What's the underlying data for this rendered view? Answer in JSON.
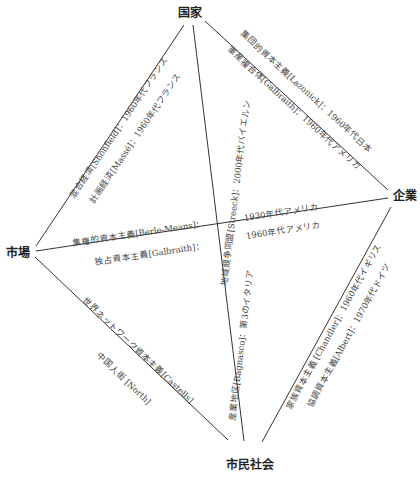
{
  "nodes": {
    "top": "国家",
    "left": "市場",
    "right": "企業",
    "bottom": "市民社会"
  },
  "edges": {
    "state_market": {
      "upper": "混合経済[Shonfield]：1960年代フランス",
      "lower": "計画経済[Massé]：1960年代フランス"
    },
    "state_firm": {
      "upper": "集団的資本主義[Lazonick]：1960年代日本",
      "lower": "軍産複合体[Galbraith]：1960年代アメリカ"
    },
    "state_civil": {
      "label": "地域競争同盟[Streeck]：2000年代バイエルン"
    },
    "market_firm": {
      "upper_left": "集権的資本主義[Berle-Means]：",
      "upper_right": "1930年代アメリカ",
      "lower_left": "独占資本主義[Galbraith]：",
      "lower_right": "1960年代アメリカ"
    },
    "market_civil": {
      "upper": "世界ネットワーク資本主義[Castells]",
      "lower": "中国人街 [North]"
    },
    "civil_industrial": {
      "label": "産業地区[Bagnasco]：第3のイタリア"
    },
    "firm_civil": {
      "upper": "家族資本主義 [Chandler]：1960年代イギリス",
      "lower": "協調資本主義[Albert]：1970年代ドイツ"
    }
  },
  "colors": {
    "line": "#333333",
    "node_text": "#222222",
    "label_text": "#444444"
  }
}
